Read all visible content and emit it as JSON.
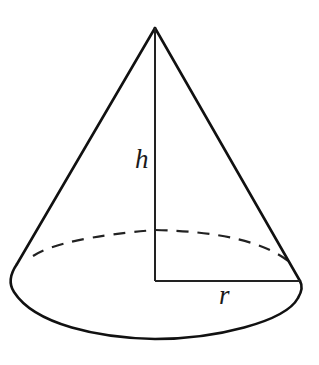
{
  "diagram": {
    "labels": {
      "height": "h",
      "radius": "r"
    },
    "colors": {
      "stroke": "#111111",
      "background": "#ffffff"
    }
  }
}
